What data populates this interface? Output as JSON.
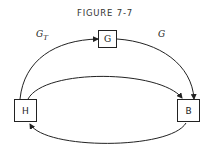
{
  "figure": {
    "title": "FIGURE 7-7"
  },
  "nodes": [
    {
      "id": "G",
      "label": "G"
    },
    {
      "id": "H",
      "label": "H"
    },
    {
      "id": "B",
      "label": "B"
    }
  ],
  "edges": [
    {
      "from": "H",
      "to": "G",
      "label_main": "G",
      "label_sub": "T"
    },
    {
      "from": "G",
      "to": "B",
      "label_main": "G",
      "label_sub": ""
    },
    {
      "from": "H",
      "to": "B",
      "label_main": "",
      "label_sub": ""
    },
    {
      "from": "B",
      "to": "H",
      "label_main": "",
      "label_sub": ""
    }
  ]
}
